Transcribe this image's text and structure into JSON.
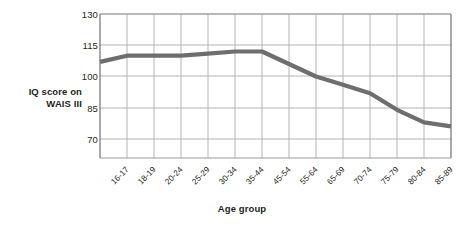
{
  "chart_data": {
    "type": "line",
    "title": "",
    "xlabel": "Age group",
    "ylabel": "IQ score on WAIS III",
    "ylabel_lines": [
      "IQ score on",
      "WAIS III"
    ],
    "categories": [
      "16-17",
      "18-19",
      "20-24",
      "25-29",
      "30-34",
      "35-44",
      "45-54",
      "55-64",
      "65-69",
      "70-74",
      "75-79",
      "80-84",
      "85-89"
    ],
    "values": [
      107,
      110,
      110,
      110,
      111,
      112,
      112,
      106,
      100,
      96,
      92,
      84,
      78
    ],
    "series": [
      {
        "name": "IQ score on WAIS III",
        "color": "#6e6e6e",
        "values": [
          107,
          110,
          110,
          110,
          111,
          112,
          112,
          106,
          100,
          96,
          92,
          84,
          78
        ]
      }
    ],
    "yticks": [
      70,
      85,
      100,
      115,
      130
    ],
    "ylim": [
      70,
      130
    ],
    "ytick_labels": [
      "70",
      "85",
      "100",
      "115",
      "130"
    ],
    "grid": true,
    "grid_color": "#b8b8b8",
    "axis_color": "#808080",
    "legend": "none",
    "line_color": "#6e6e6e",
    "line_width": 4.2
  },
  "figure": {
    "background_color": "#ffffff",
    "text_color": "#231f20"
  }
}
